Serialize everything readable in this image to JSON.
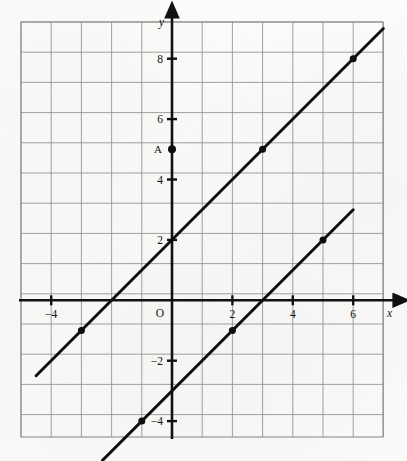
{
  "figure": {
    "kind": "coordinate-plane-graph",
    "background_color": "#fbfbfa",
    "grid_color": "#8d8d8d",
    "axis_color": "#111111",
    "line_color": "#0d0d0d"
  },
  "axes": {
    "x_axis_label": "x",
    "y_axis_label": "y",
    "origin_label": "O",
    "x_ticks": [
      {
        "value": -4,
        "label": "−4"
      },
      {
        "value": 2,
        "label": "2"
      },
      {
        "value": 4,
        "label": "4"
      },
      {
        "value": 6,
        "label": "6"
      }
    ],
    "y_ticks": [
      {
        "value": 8,
        "label": "8"
      },
      {
        "value": 6,
        "label": "6"
      },
      {
        "value": 4,
        "label": "4"
      },
      {
        "value": 2,
        "label": "2"
      },
      {
        "value": -2,
        "label": "−2"
      },
      {
        "value": -4,
        "label": "−4"
      }
    ]
  },
  "annotations": [
    {
      "name": "point-A",
      "label": "A",
      "x": 0,
      "y": 5
    }
  ],
  "chart_data": {
    "type": "line",
    "title": "",
    "xlabel": "x",
    "ylabel": "y",
    "xlim": [
      -5,
      7
    ],
    "ylim": [
      -6,
      9.5
    ],
    "grid": true,
    "grid_step": 1,
    "legend": "none",
    "series": [
      {
        "name": "upper-line",
        "equation": "y = x + 2",
        "slope": 1,
        "intercept": 2,
        "endpoints": [
          {
            "x": -4.5,
            "y": -2.5
          },
          {
            "x": 7.0,
            "y": 9.0
          }
        ],
        "marked_points": [
          {
            "x": -3,
            "y": -1
          },
          {
            "x": 3,
            "y": 5
          },
          {
            "x": 6,
            "y": 8
          }
        ]
      },
      {
        "name": "lower-line",
        "equation": "y = x − 3",
        "slope": 1,
        "intercept": -3,
        "endpoints": [
          {
            "x": -2.3,
            "y": -5.3
          },
          {
            "x": 6.0,
            "y": 3.0
          }
        ],
        "marked_points": [
          {
            "x": -1,
            "y": -4
          },
          {
            "x": 2,
            "y": -1
          },
          {
            "x": 5,
            "y": 2
          }
        ]
      }
    ]
  }
}
